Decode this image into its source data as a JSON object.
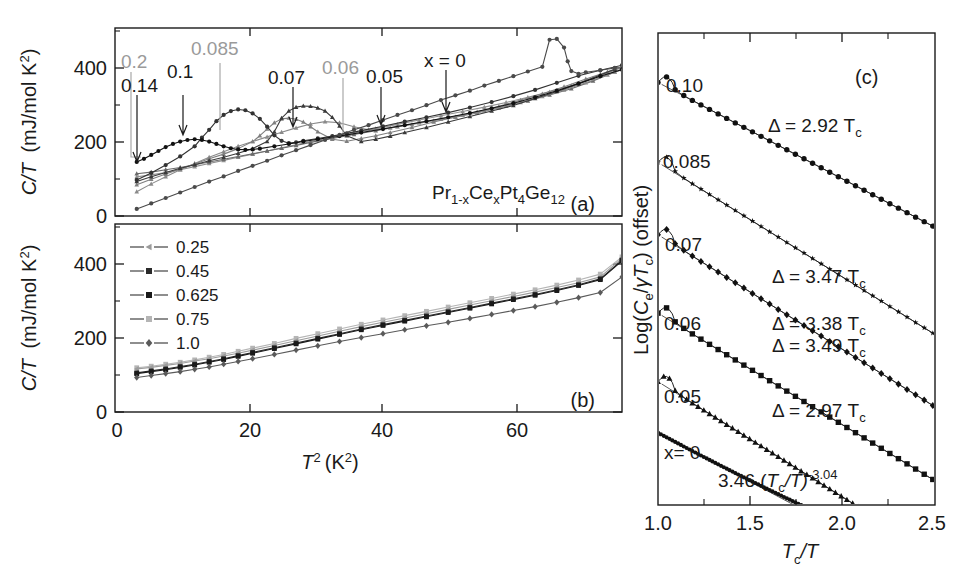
{
  "figure": {
    "panels": [
      "a",
      "b",
      "c"
    ],
    "compound": {
      "prefix": "Pr",
      "sub1": "1-x",
      "mid": "Ce",
      "sub2": "x",
      "mid2": "Pt",
      "sub3": "4",
      "mid3": "Ge",
      "sub4": "12",
      "full": "Pr(1-x)Ce(x)Pt4Ge12"
    }
  },
  "panel_a": {
    "tag": "(a)",
    "ylabel_main": "C/T",
    "ylabel_units": "(mJ/mol K",
    "ylabel_units_sup": "2",
    "ylabel_units_end": ")",
    "yticks": [
      "0",
      "200",
      "400"
    ],
    "xticks": [
      "0",
      "20",
      "40",
      "60"
    ],
    "annotations": [
      {
        "label": "0.2",
        "color": "#9a9a9a"
      },
      {
        "label": "0.14",
        "color": "#1a1a1a"
      },
      {
        "label": "0.1",
        "color": "#1a1a1a"
      },
      {
        "label": "0.085",
        "color": "#9a9a9a"
      },
      {
        "label": "0.07",
        "color": "#1a1a1a"
      },
      {
        "label": "0.06",
        "color": "#9a9a9a"
      },
      {
        "label": "0.05",
        "color": "#1a1a1a"
      },
      {
        "label": "x = 0",
        "color": "#1a1a1a"
      }
    ]
  },
  "panel_b": {
    "tag": "(b)",
    "ylabel_main": "C/T",
    "ylabel_units": "(mJ/mol K",
    "ylabel_units_sup": "2",
    "ylabel_units_end": ")",
    "yticks": [
      "0",
      "200",
      "400"
    ],
    "xticks": [
      "0",
      "20",
      "40",
      "60"
    ],
    "xlabel_main": "T",
    "xlabel_sup": "2",
    "xlabel_units": "(K",
    "xlabel_units_sup": "2",
    "xlabel_units_end": ")",
    "legend": [
      "0.25",
      "0.45",
      "0.625",
      "0.75",
      "1.0"
    ]
  },
  "panel_c": {
    "tag": "(c)",
    "ylabel_pre": "Log(",
    "ylabel_ce": "C",
    "ylabel_ce_sub": "e",
    "ylabel_mid": "/",
    "ylabel_gt": "γT",
    "ylabel_gt_sub": "c",
    "ylabel_post": ") (offset)",
    "xlabel_main": "T",
    "xlabel_sub": "c",
    "xlabel_end": "/T",
    "xticks": [
      "1.0",
      "1.5",
      "2.0",
      "2.5"
    ],
    "curve_labels": [
      "0.10",
      "0.085",
      "0.07",
      "0.06",
      "0.05",
      "x= 0"
    ],
    "gap_annotations": [
      "Δ = 2.92  T",
      "Δ = 3.47  T",
      "Δ = 3.38  T",
      "Δ = 3.49  T",
      "Δ = 2.97  T"
    ],
    "gap_sub": "c",
    "power_law_pre": "3.46 (",
    "power_law_tc": "T",
    "power_law_tc_sub": "c",
    "power_law_mid": "/T)",
    "power_law_exp": "-3.04"
  },
  "chart_data": [
    {
      "type": "line",
      "panel": "a",
      "title": "",
      "xlabel": "T^2 (K^2)",
      "ylabel": "C/T (mJ/mol K^2)",
      "xlim": [
        0,
        70
      ],
      "ylim": [
        0,
        480
      ],
      "grid": false,
      "legend": "none",
      "series": [
        {
          "name": "x = 0",
          "color": "#4a4a4a",
          "marker": "circle",
          "x": [
            3,
            5,
            7,
            9,
            11,
            13,
            15,
            17,
            19,
            21,
            23,
            25,
            27,
            29,
            31,
            33,
            35,
            37,
            39,
            41,
            43,
            45,
            47,
            49,
            51,
            53,
            55,
            57,
            59,
            60,
            61,
            62,
            62.5,
            63,
            64,
            65,
            67,
            69
          ],
          "y": [
            18,
            32,
            46,
            60,
            74,
            88,
            101,
            115,
            128,
            141,
            155,
            168,
            181,
            194,
            207,
            220,
            232,
            245,
            258,
            270,
            283,
            296,
            308,
            320,
            333,
            345,
            357,
            369,
            381,
            450,
            452,
            430,
            395,
            370,
            363,
            367,
            372,
            378
          ]
        },
        {
          "name": "0.05",
          "color": "#3a3a3a",
          "marker": "triangle",
          "x": [
            3,
            5,
            7,
            9,
            11,
            13,
            15,
            17,
            19,
            21,
            22,
            23,
            24,
            25,
            26,
            27,
            28,
            29,
            30,
            31,
            32,
            34,
            36,
            38,
            40,
            43,
            46,
            49,
            52,
            55,
            58,
            61,
            64,
            67,
            69
          ],
          "y": [
            88,
            100,
            111,
            122,
            131,
            141,
            150,
            160,
            172,
            190,
            215,
            250,
            268,
            278,
            281,
            280,
            276,
            268,
            252,
            230,
            205,
            190,
            196,
            204,
            213,
            226,
            240,
            254,
            268,
            282,
            300,
            318,
            338,
            360,
            375
          ]
        },
        {
          "name": "0.06",
          "color": "#7f7f7f",
          "marker": "triangle",
          "x": [
            3,
            5,
            7,
            9,
            11,
            13,
            15,
            17,
            19,
            20,
            21,
            22,
            23,
            24,
            25,
            26,
            27,
            28,
            30,
            32,
            34,
            36,
            38,
            41,
            44,
            47,
            50,
            53,
            56,
            59,
            62,
            65,
            68,
            70
          ],
          "y": [
            80,
            94,
            107,
            120,
            133,
            146,
            158,
            172,
            190,
            205,
            222,
            238,
            248,
            250,
            247,
            240,
            228,
            215,
            196,
            191,
            198,
            205,
            213,
            226,
            240,
            253,
            266,
            280,
            296,
            312,
            330,
            350,
            368,
            378
          ]
        },
        {
          "name": "0.07",
          "color": "#333333",
          "marker": "circle",
          "x": [
            3,
            5,
            7,
            9,
            11,
            12,
            13,
            14,
            15,
            16,
            17,
            18,
            19,
            20,
            21,
            22,
            23,
            24,
            25,
            26,
            28,
            30,
            32,
            34,
            37,
            40,
            43,
            46,
            49,
            52,
            55,
            58,
            61,
            64,
            67,
            70
          ],
          "y": [
            92,
            110,
            130,
            152,
            178,
            200,
            220,
            242,
            258,
            268,
            272,
            270,
            262,
            248,
            228,
            206,
            192,
            186,
            188,
            192,
            198,
            204,
            211,
            218,
            229,
            241,
            252,
            264,
            277,
            291,
            306,
            322,
            340,
            358,
            372,
            385
          ]
        },
        {
          "name": "0.085",
          "color": "#8a8a8a",
          "marker": "triangle",
          "x": [
            3,
            5,
            7,
            9,
            11,
            13,
            15,
            17,
            19,
            21,
            23,
            25,
            27,
            29,
            31,
            33,
            35,
            38,
            41,
            44,
            47,
            50,
            53,
            56,
            59,
            62,
            65,
            68,
            70
          ],
          "y": [
            62,
            82,
            100,
            118,
            134,
            150,
            164,
            178,
            190,
            202,
            214,
            225,
            235,
            241,
            238,
            228,
            220,
            225,
            234,
            243,
            252,
            263,
            276,
            290,
            305,
            322,
            340,
            360,
            374
          ]
        },
        {
          "name": "0.1",
          "color": "#111111",
          "marker": "circle",
          "x": [
            3,
            4,
            5,
            6,
            7,
            8,
            9,
            10,
            11,
            12,
            13,
            14,
            15,
            16,
            17,
            18,
            19,
            20,
            22,
            24,
            26,
            28,
            31,
            34,
            37,
            40,
            43,
            46,
            49,
            52,
            55,
            58,
            61,
            64,
            67,
            70
          ],
          "y": [
            138,
            146,
            156,
            166,
            176,
            184,
            190,
            194,
            196,
            194,
            190,
            184,
            178,
            173,
            170,
            169,
            170,
            172,
            178,
            184,
            190,
            196,
            204,
            213,
            222,
            232,
            242,
            252,
            263,
            275,
            288,
            303,
            320,
            338,
            357,
            374
          ]
        },
        {
          "name": "0.14",
          "color": "#6a6a6a",
          "marker": "triangle",
          "x": [
            3,
            5,
            7,
            9,
            11,
            13,
            15,
            17,
            19,
            21,
            23,
            25,
            27,
            30,
            33,
            36,
            39,
            42,
            45,
            48,
            51,
            54,
            57,
            60,
            63,
            66,
            69
          ],
          "y": [
            108,
            112,
            118,
            124,
            131,
            138,
            145,
            152,
            159,
            166,
            173,
            180,
            188,
            198,
            208,
            218,
            228,
            238,
            248,
            258,
            269,
            281,
            294,
            309,
            325,
            345,
            368
          ]
        },
        {
          "name": "0.2",
          "color": "#909090",
          "marker": "triangle",
          "x": [
            3,
            5,
            7,
            9,
            11,
            13,
            15,
            17,
            19,
            21,
            23,
            25,
            27,
            30,
            33,
            36,
            39,
            42,
            45,
            48,
            51,
            54,
            57,
            60,
            63,
            66,
            69
          ],
          "y": [
            100,
            105,
            111,
            118,
            126,
            134,
            142,
            150,
            158,
            166,
            174,
            182,
            190,
            201,
            212,
            223,
            234,
            245,
            256,
            267,
            278,
            290,
            303,
            317,
            333,
            352,
            372
          ]
        }
      ]
    },
    {
      "type": "line",
      "panel": "b",
      "xlabel": "T^2 (K^2)",
      "ylabel": "C/T (mJ/mol K^2)",
      "xlim": [
        0,
        70
      ],
      "ylim": [
        0,
        480
      ],
      "grid": false,
      "legend": "upper-left",
      "series": [
        {
          "name": "0.25",
          "color": "#9b9b9b",
          "marker": "triangle-left",
          "x": [
            3,
            5,
            7,
            9,
            11,
            13,
            15,
            17,
            19,
            22,
            25,
            28,
            31,
            34,
            37,
            40,
            43,
            46,
            49,
            52,
            55,
            58,
            61,
            64,
            67,
            70
          ],
          "y": [
            110,
            114,
            119,
            124,
            130,
            136,
            143,
            150,
            158,
            170,
            182,
            194,
            206,
            218,
            229,
            240,
            251,
            262,
            273,
            284,
            295,
            306,
            318,
            330,
            345,
            392
          ]
        },
        {
          "name": "0.45",
          "color": "#2b2b2b",
          "marker": "square",
          "x": [
            3,
            5,
            7,
            9,
            11,
            13,
            15,
            17,
            19,
            22,
            25,
            28,
            31,
            34,
            37,
            40,
            43,
            46,
            49,
            52,
            55,
            58,
            61,
            64,
            67,
            70
          ],
          "y": [
            100,
            105,
            110,
            116,
            122,
            129,
            136,
            144,
            152,
            164,
            176,
            188,
            200,
            212,
            223,
            234,
            245,
            256,
            267,
            278,
            289,
            300,
            312,
            325,
            340,
            388
          ]
        },
        {
          "name": "0.625",
          "color": "#1a1a1a",
          "marker": "square",
          "x": [
            3,
            5,
            7,
            9,
            11,
            13,
            15,
            17,
            19,
            22,
            25,
            28,
            31,
            34,
            37,
            40,
            43,
            46,
            49,
            52,
            55,
            58,
            61,
            64,
            67,
            70
          ],
          "y": [
            98,
            103,
            108,
            114,
            120,
            127,
            134,
            142,
            150,
            162,
            174,
            186,
            198,
            210,
            221,
            232,
            243,
            254,
            265,
            276,
            287,
            298,
            310,
            323,
            338,
            386
          ]
        },
        {
          "name": "0.75",
          "color": "#b5b5b5",
          "marker": "square",
          "x": [
            3,
            5,
            7,
            9,
            11,
            13,
            15,
            17,
            19,
            22,
            25,
            28,
            31,
            34,
            37,
            40,
            43,
            46,
            49,
            52,
            55,
            58,
            61,
            64,
            67,
            70
          ],
          "y": [
            113,
            117,
            122,
            127,
            133,
            140,
            147,
            155,
            163,
            175,
            188,
            200,
            212,
            224,
            235,
            246,
            257,
            268,
            279,
            290,
            301,
            312,
            324,
            337,
            352,
            396
          ]
        },
        {
          "name": "1.0",
          "color": "#5a5a5a",
          "marker": "diamond",
          "x": [
            3,
            5,
            7,
            9,
            11,
            13,
            15,
            17,
            19,
            22,
            25,
            28,
            31,
            34,
            37,
            40,
            43,
            46,
            49,
            52,
            55,
            58,
            61,
            64,
            67,
            70
          ],
          "y": [
            88,
            93,
            98,
            103,
            109,
            115,
            122,
            129,
            136,
            147,
            158,
            169,
            180,
            190,
            200,
            210,
            220,
            229,
            239,
            249,
            259,
            269,
            280,
            292,
            305,
            345
          ]
        }
      ]
    },
    {
      "type": "line",
      "panel": "c",
      "xlabel": "Tc/T",
      "ylabel": "Log(Ce/gamma*Tc) (offset)",
      "xlim": [
        1.0,
        2.5
      ],
      "ylim": [
        0,
        6.2
      ],
      "grid": false,
      "legend": "inline-labels",
      "series": [
        {
          "name": "0.10",
          "offset": 5.55,
          "slope": -1.268,
          "marker": "circle",
          "delta": 2.92
        },
        {
          "name": "0.085",
          "offset": 4.5,
          "slope": -1.507,
          "marker": "star",
          "delta": null
        },
        {
          "name": "0.07",
          "offset": 3.55,
          "slope": -1.507,
          "marker": "diamond",
          "delta": 3.47
        },
        {
          "name": "0.06",
          "offset": 2.52,
          "slope": -1.468,
          "marker": "square",
          "delta": 3.38
        },
        {
          "name": "0.05",
          "offset": 1.62,
          "slope": -1.516,
          "marker": "triangle",
          "delta": 3.49
        },
        {
          "name": "x= 0",
          "offset": 0.95,
          "slope": -1.29,
          "marker": "circle",
          "delta": 2.97,
          "power_law": "3.46 (Tc/T)^-3.04"
        }
      ]
    }
  ]
}
